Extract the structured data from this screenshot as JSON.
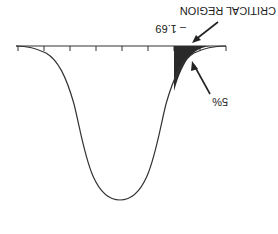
{
  "diagram": {
    "orientation": "rotated-180",
    "labels": {
      "critical_region": "CRITICAL REGION",
      "critical_value": "– 1.69",
      "tail_area": "5%"
    },
    "colors": {
      "curve": "#333333",
      "shaded_region": "#2a2a2a",
      "axis": "#333333",
      "background": "#ffffff"
    },
    "axis": {
      "tick_count": 9
    }
  }
}
